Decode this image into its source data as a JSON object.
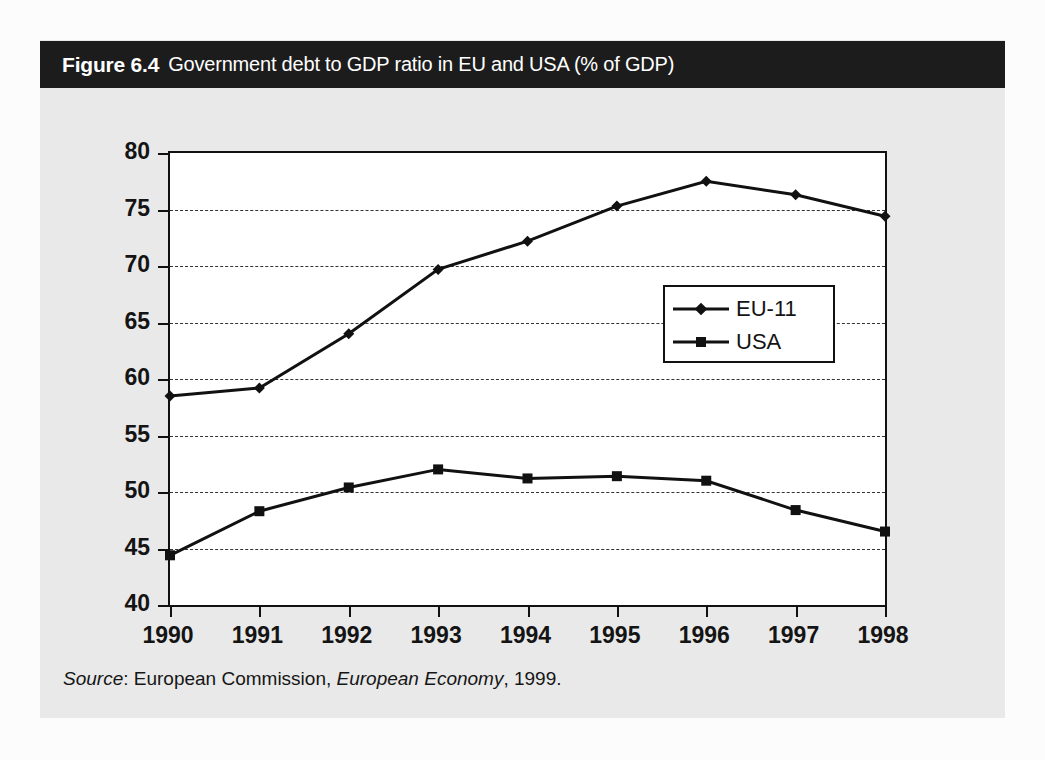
{
  "figure": {
    "label": "Figure 6.4",
    "caption": "Government debt to GDP  ratio in EU and USA (% of GDP)",
    "source_prefix": "Source",
    "source_sep": ": ",
    "source_org": "European Commission, ",
    "source_pub": "European Economy",
    "source_year": ", 1999.",
    "title_bar_color": "#1c1c1c",
    "panel_color": "#e9e9e9",
    "ink_color": "#111111"
  },
  "chart_data": {
    "type": "line",
    "title": "Government debt to GDP  ratio in EU and USA (% of GDP)",
    "xlabel": "",
    "ylabel": "",
    "x": [
      1990,
      1991,
      1992,
      1993,
      1994,
      1995,
      1996,
      1997,
      1998
    ],
    "categories": [
      "1990",
      "1991",
      "1992",
      "1993",
      "1994",
      "1995",
      "1996",
      "1997",
      "1998"
    ],
    "series": [
      {
        "name": "EU-11",
        "marker": "diamond",
        "values": [
          58.5,
          59.2,
          64.0,
          69.7,
          72.2,
          75.3,
          77.5,
          76.3,
          74.4
        ]
      },
      {
        "name": "USA",
        "marker": "square",
        "values": [
          44.4,
          48.3,
          50.4,
          52.0,
          51.2,
          51.4,
          51.0,
          48.4,
          46.5
        ]
      }
    ],
    "ylim": [
      40,
      80
    ],
    "yticks": [
      40,
      45,
      50,
      55,
      60,
      65,
      70,
      75,
      80
    ],
    "ytick_labels": [
      "40",
      "45",
      "50",
      "55",
      "60",
      "65",
      "70",
      "75",
      "80"
    ],
    "xlim": [
      1990,
      1998
    ],
    "grid": true,
    "grid_style": "dashed-horizontal",
    "legend_position": "inside-right"
  }
}
